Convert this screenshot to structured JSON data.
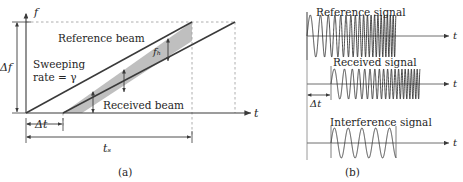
{
  "figure": {
    "caption_a": "(a)",
    "caption_b": "(b)"
  },
  "panel_a": {
    "y_axis_label": "f",
    "x_axis_label": "t",
    "delta_f_label": "Δf",
    "delta_t_label": "Δt",
    "ts_label": "tₛ",
    "beat_freq_label": "fₕ",
    "reference_beam_label": "Reference beam",
    "received_beam_label": "Received beam",
    "sweeping_rate_line1": "Sweeping",
    "sweeping_rate_line2": "rate = γ"
  },
  "panel_b": {
    "reference_signal_label": "Reference signal",
    "received_signal_label": "Received signal",
    "interference_signal_label": "Interference signal",
    "delta_t_label": "Δt",
    "axis_label_1": "t",
    "axis_label_2": "t",
    "axis_label_3": "t"
  },
  "colors": {
    "line": "#3a3a3a",
    "band_fill": "#bfbfbf",
    "band_stroke": "#4a4a4a",
    "dashed": "#9a9a9a",
    "text": "#262626",
    "wave": "#2b2b2b"
  },
  "chart_data": {
    "type": "line",
    "panels": [
      {
        "id": "a",
        "xlabel": "t",
        "ylabel": "f",
        "description": "Linear frequency sweep: reference beam and time-delayed received beam; vertical gap between the two ramps is the beat frequency f_b.",
        "series": [
          {
            "name": "Reference beam",
            "x": [
              0,
              1.22
            ],
            "y": [
              0,
              1.22
            ],
            "slope_symbol": "γ"
          },
          {
            "name": "Received beam",
            "x": [
              0.175,
              1.395
            ],
            "y": [
              0,
              1.22
            ],
            "slope_symbol": "γ"
          }
        ],
        "annotations": [
          {
            "name": "Δf",
            "type": "vertical-extent",
            "from": 0.0,
            "to": 1.0
          },
          {
            "name": "Δt",
            "type": "horizontal-extent",
            "from": 0.0,
            "to": 0.175
          },
          {
            "name": "tₛ",
            "type": "horizontal-extent",
            "from": 0.0,
            "to": 1.0
          },
          {
            "name": "fₕ",
            "type": "vertical-gap",
            "value": 0.175
          },
          {
            "name": "beat-arrows",
            "type": "double-arrow",
            "x": [
              0.3,
              0.52,
              0.8
            ]
          }
        ],
        "shaded_region": {
          "label": "overlap region",
          "x_start": 0.175,
          "x_end": 1.0
        },
        "grid": false
      },
      {
        "id": "b",
        "xlabel": "t",
        "description": "Time-domain chirps. Reference and received signals sweep from low to high frequency; received is delayed by Δt. Their mixing yields a constant-frequency interference (beat) signal.",
        "series": [
          {
            "name": "Reference signal",
            "type": "chirp",
            "t_start": 0.0,
            "t_end": 0.7,
            "f_start": 9,
            "f_end": 46
          },
          {
            "name": "Received signal",
            "type": "chirp",
            "t_start": 0.175,
            "t_end": 0.875,
            "f_start": 9,
            "f_end": 46
          },
          {
            "name": "Interference signal",
            "type": "sine",
            "t_start": 0.175,
            "t_end": 0.7,
            "frequency": 9
          }
        ],
        "annotations": [
          {
            "name": "Δt",
            "type": "horizontal-extent",
            "from": 0.0,
            "to": 0.175
          }
        ],
        "grid": false
      }
    ]
  }
}
